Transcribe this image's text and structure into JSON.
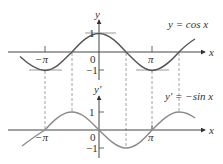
{
  "diagram": {
    "top_plot": {
      "function_label": "y = cos x",
      "y_axis_label": "y",
      "x_axis_label": "x",
      "y_ticks": [
        "1",
        "−1"
      ],
      "origin_label": "0",
      "x_ticks": [
        "−π",
        "π"
      ]
    },
    "bottom_plot": {
      "function_label": "y′ = −sin x",
      "y_axis_label": "y′",
      "x_axis_label": "x",
      "y_ticks": [
        "1",
        "−1"
      ],
      "origin_label": "0",
      "x_ticks": [
        "−π",
        "π"
      ]
    },
    "colors": {
      "axis": "#444444",
      "cos_curve": "#555555",
      "sin_curve": "#8a8a8a",
      "dashed": "#888888",
      "tangent": "#999999"
    }
  }
}
